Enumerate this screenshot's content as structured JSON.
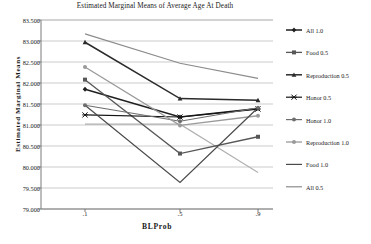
{
  "chart_data": {
    "type": "line",
    "title": "Estimated Marginal Means of Average Age At Death",
    "xlabel": "BLProb",
    "ylabel": "Estimated Marginal Means",
    "categories": [
      ".1",
      ".5",
      ".9"
    ],
    "x": [
      0.1,
      0.5,
      0.9
    ],
    "ylim": [
      79.0,
      83.5
    ],
    "ytick_labels": [
      "83.500",
      "83.000",
      "82.500",
      "82.000",
      "81.500",
      "81.000",
      "80.500",
      "80.000",
      "79.500",
      "79.000"
    ],
    "ytick_values": [
      83.5,
      83.0,
      82.5,
      82.0,
      81.5,
      81.0,
      80.5,
      80.0,
      79.5,
      79.0
    ],
    "grid": true,
    "legend_position": "right",
    "series": [
      {
        "name": "All 1.0",
        "values": [
          81.85,
          81.19,
          81.39
        ],
        "color": "#1f1f1f",
        "marker": "diamond",
        "width": 1.5
      },
      {
        "name": "Food 0.5",
        "values": [
          82.08,
          80.32,
          80.72
        ],
        "color": "#575757",
        "marker": "square",
        "width": 1.3
      },
      {
        "name": "Reproduction 0.5",
        "values": [
          82.97,
          81.63,
          81.59
        ],
        "color": "#2b2b2b",
        "marker": "triangle",
        "width": 1.5
      },
      {
        "name": "Honor 0.5",
        "values": [
          81.24,
          81.19,
          81.38
        ],
        "color": "#141414",
        "marker": "cross",
        "width": 1.2
      },
      {
        "name": "Honor 1.0",
        "values": [
          81.47,
          81.09,
          81.41
        ],
        "color": "#6e6e6e",
        "marker": "circle",
        "width": 1.2
      },
      {
        "name": "Reproduction 1.0",
        "values": [
          82.38,
          80.99,
          81.22
        ],
        "color": "#9a9a9a",
        "marker": "circle",
        "width": 1.3
      },
      {
        "name": "Food 1.0",
        "values": [
          81.47,
          79.63,
          81.41
        ],
        "color": "#4a4a4a",
        "marker": "none",
        "width": 1.2
      },
      {
        "name": "All 0.5",
        "values": [
          83.17,
          82.47,
          82.11
        ],
        "color": "#8c8c8c",
        "marker": "none",
        "width": 1.2
      }
    ],
    "extra_descending_series": {
      "name": "All 0.5 descending branch",
      "values": [
        81.02,
        81.02,
        79.87
      ],
      "color": "#b0b0b0"
    }
  },
  "legend": {
    "entries": [
      {
        "label": "All 1.0"
      },
      {
        "label": "Food 0.5"
      },
      {
        "label": "Reproduction 0.5"
      },
      {
        "label": "Honor 0.5"
      },
      {
        "label": "Honor 1.0"
      },
      {
        "label": "Reproduction 1.0"
      },
      {
        "label": "Food 1.0"
      },
      {
        "label": "All 0.5"
      }
    ]
  },
  "colors": {
    "axis": "#6b6b6b",
    "grid": "#a8a8a8",
    "text": "#1a1a1a",
    "background": "#ffffff"
  }
}
